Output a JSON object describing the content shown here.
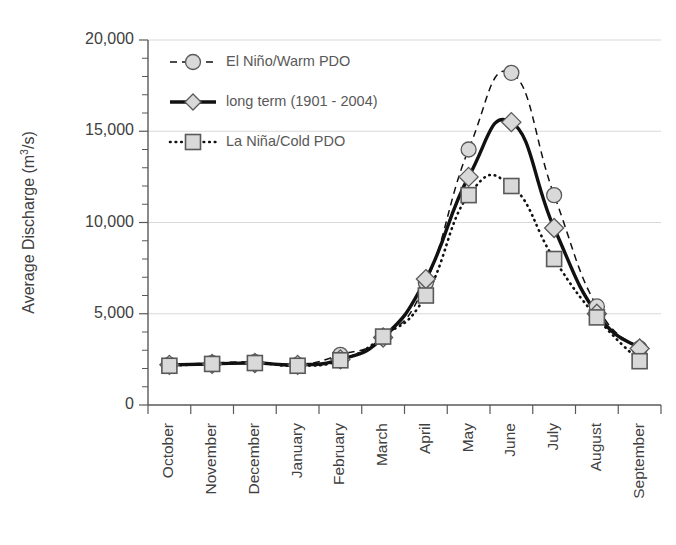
{
  "chart_data": {
    "type": "line",
    "title": "",
    "xlabel": "",
    "ylabel": "Average Discharge (m3/s)",
    "ylabel_text": "Average Discharge (m",
    "ylabel_sup": "3",
    "ylabel_tail": "/s)",
    "ylim": [
      0,
      20000
    ],
    "ytick_values": [
      0,
      5000,
      10000,
      15000,
      20000
    ],
    "ytick_labels": [
      "0",
      "5,000",
      "10,000",
      "15,000",
      "20,000"
    ],
    "yminor_step": 1000,
    "grid": true,
    "grid_axis": "y",
    "legend_position": "upper-left-inside",
    "categories": [
      "October",
      "November",
      "December",
      "January",
      "February",
      "March",
      "April",
      "May",
      "June",
      "July",
      "August",
      "September"
    ],
    "series": [
      {
        "name": "El Niño/Warm PDO",
        "marker": "circle",
        "line_style": "dashed",
        "values": [
          2200,
          2300,
          2350,
          2200,
          2750,
          3700,
          6700,
          14000,
          18200,
          11500,
          5400,
          3100
        ]
      },
      {
        "name": "long term (1901 - 2004)",
        "marker": "diamond",
        "line_style": "solid",
        "values": [
          2200,
          2250,
          2300,
          2200,
          2500,
          3700,
          6900,
          12500,
          15500,
          9700,
          5000,
          3100
        ]
      },
      {
        "name": "La Niña/Cold PDO",
        "marker": "square",
        "line_style": "dotted",
        "values": [
          2150,
          2250,
          2300,
          2150,
          2450,
          3750,
          6000,
          11500,
          12000,
          8000,
          4800,
          2400
        ]
      }
    ]
  },
  "legend": {
    "items": [
      {
        "label": "El Niño/Warm PDO"
      },
      {
        "label": "long term (1901 - 2004)"
      },
      {
        "label": "La Niña/Cold PDO"
      }
    ]
  },
  "colors": {
    "line": "#111111",
    "marker_fill": "#d9d9d9",
    "marker_stroke": "#595959",
    "grid": "#d9d9d9",
    "axis": "#595959",
    "text": "#404040",
    "legend_text": "#595959",
    "background": "#ffffff"
  }
}
